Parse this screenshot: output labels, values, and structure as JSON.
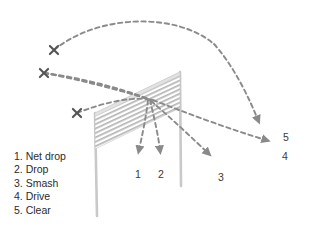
{
  "diagram": {
    "colors": {
      "net_mesh": "#b5b5b5",
      "net_tape": "#d8d8d8",
      "post": "#c9c9c9",
      "trajectory": "#8a8a8a",
      "mark": "#555555",
      "text": "#2b2b2b"
    },
    "net": {
      "top_left": [
        95,
        113
      ],
      "top_right": [
        180,
        72
      ],
      "bottom_right": [
        180,
        108
      ],
      "bottom_left": [
        95,
        149
      ],
      "stripe_count": 11
    },
    "posts": [
      {
        "name": "left-post",
        "x_top": 95,
        "y_top": 113,
        "x_bottom": 97,
        "y_bottom": 216
      },
      {
        "name": "right-post",
        "x_top": 180,
        "y_top": 72,
        "x_bottom": 181,
        "y_bottom": 186
      }
    ],
    "contact_marks": [
      {
        "name": "clear-origin",
        "x": 54,
        "y": 50
      },
      {
        "name": "drive-origin",
        "x": 44,
        "y": 73
      },
      {
        "name": "net-drop-origin",
        "x": 77,
        "y": 113
      }
    ],
    "impact_point": [
      150,
      100
    ]
  },
  "shots": [
    {
      "id": 1,
      "name": "net-drop",
      "label": "1",
      "legend": "1. Net drop",
      "label_pos": [
        135,
        168
      ],
      "arrow_tip": [
        139,
        158
      ],
      "path": "M 77,113 C 100,104 126,97 148,99",
      "descent": "M 148,100 C 146,118 142,136 139,150"
    },
    {
      "id": 2,
      "name": "drop",
      "label": "2",
      "legend": "2. Drop",
      "label_pos": [
        158,
        168
      ],
      "arrow_tip": [
        160,
        158
      ],
      "path": "M 44,73 C 78,77 120,88 149,99",
      "descent": "M 150,100 C 154,117 158,134 160,150"
    },
    {
      "id": 3,
      "name": "smash",
      "label": "3",
      "legend": "3. Smash",
      "label_pos": [
        218,
        171
      ],
      "arrow_tip": [
        212,
        159
      ],
      "path": "M 44,73 C 80,79 124,90 150,100",
      "descent": "M 151,101 C 170,117 192,138 208,153"
    },
    {
      "id": 4,
      "name": "drive",
      "label": "4",
      "legend": "4. Drive",
      "label_pos": [
        282,
        150
      ],
      "arrow_tip": [
        272,
        143
      ],
      "path": "M 44,73 C 82,80 126,92 152,100",
      "descent": "M 153,100 C 186,113 232,130 266,140"
    },
    {
      "id": 5,
      "name": "clear",
      "label": "5",
      "legend": "5. Clear",
      "label_pos": [
        283,
        131
      ],
      "arrow_tip": [
        261,
        127
      ],
      "path": "M 54,50 C 98,14 176,12 214,44",
      "descent": "M 214,44 C 234,66 250,100 258,120"
    }
  ],
  "legend": {
    "items": [
      "1. Net drop",
      "2. Drop",
      "3. Smash",
      "4. Drive",
      "5. Clear"
    ]
  }
}
